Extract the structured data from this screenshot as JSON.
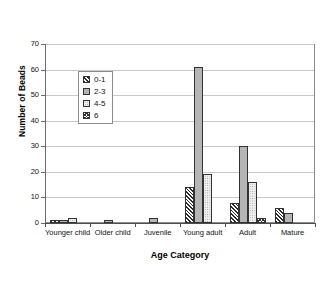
{
  "chart_data": {
    "type": "bar",
    "title": "",
    "subtitle": "",
    "xlabel": "Age Category",
    "ylabel": "Number of Beads",
    "categories": [
      "Younger child",
      "Older child",
      "Juvenile",
      "Young adult",
      "Adult",
      "Mature"
    ],
    "series": [
      {
        "name": "0-1",
        "values": [
          1,
          0,
          0,
          14,
          8,
          6
        ]
      },
      {
        "name": "2-3",
        "values": [
          1,
          1,
          2,
          61,
          30,
          4
        ]
      },
      {
        "name": "4-5",
        "values": [
          2,
          0,
          0,
          19,
          16,
          0
        ]
      },
      {
        "name": "6",
        "values": [
          0,
          0,
          0,
          0,
          2,
          0
        ]
      }
    ],
    "ylim": [
      0,
      70
    ],
    "yticks": [
      0,
      10,
      20,
      30,
      40,
      50,
      60,
      70
    ],
    "ytick_labels": [
      "0",
      "10",
      "20",
      "30",
      "40",
      "50",
      "60",
      "70"
    ],
    "grid": "horizontal",
    "legend_position": "upper-left-inside",
    "legend_entries": [
      "0-1",
      "2-3",
      "4-5",
      "6"
    ],
    "colors": {
      "series_0": "#2b2b2b",
      "series_1": "#b5b5b5",
      "series_2": "#efefef",
      "series_3": "#313131",
      "grid": "#c8c8c8",
      "axis": "#4d4d4d",
      "background": "#ffffff"
    }
  }
}
